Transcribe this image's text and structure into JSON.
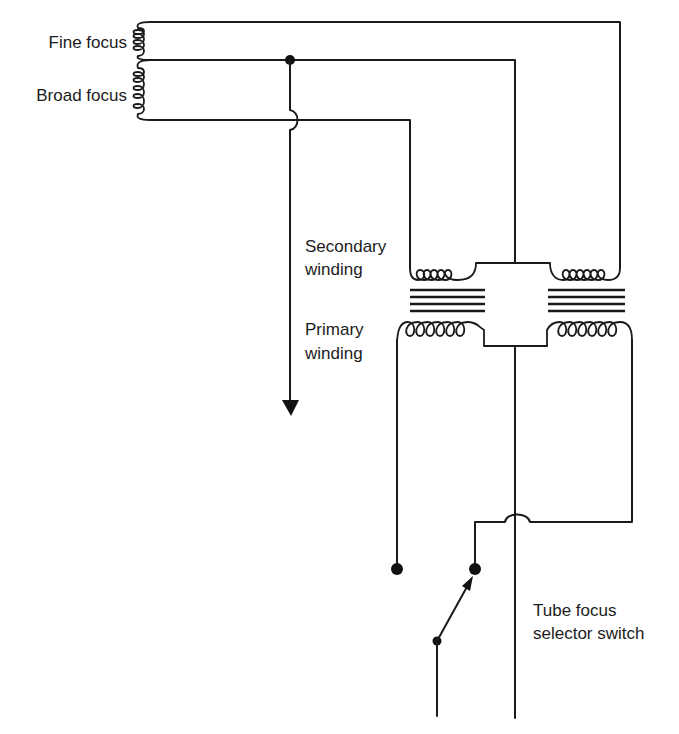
{
  "diagram": {
    "type": "circuit-schematic",
    "labels": {
      "fine_focus": "Fine focus",
      "broad_focus": "Broad focus",
      "secondary_line1": "Secondary",
      "secondary_line2": "winding",
      "primary_line1": "Primary",
      "primary_line2": "winding",
      "switch_line1": "Tube focus",
      "switch_line2": "selector switch"
    },
    "components": [
      {
        "id": "fine-focus-filament",
        "label": "Fine focus"
      },
      {
        "id": "broad-focus-filament",
        "label": "Broad focus"
      },
      {
        "id": "filament-transformer-left",
        "parts": [
          "Secondary winding",
          "Primary winding"
        ]
      },
      {
        "id": "filament-transformer-right",
        "parts": [
          "Secondary winding",
          "Primary winding"
        ]
      },
      {
        "id": "tube-focus-selector-switch",
        "label": "Tube focus selector switch"
      }
    ],
    "colors": {
      "ink": "#1a1a1a",
      "background": "#ffffff"
    }
  }
}
